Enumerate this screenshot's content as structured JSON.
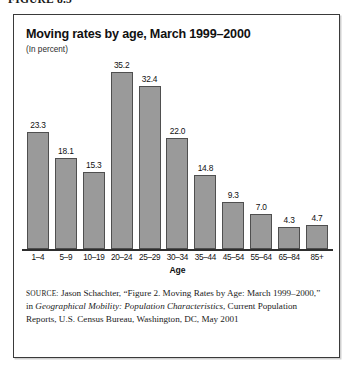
{
  "figure": {
    "caption": "FIGURE 8.5"
  },
  "chart_panel": {
    "title": "Moving rates by age, March 1999–2000",
    "subtitle": "(In percent)",
    "bar_fill_color": "#9a9a9a",
    "bar_outline_color": "#4f4f4f",
    "frame_color": "#3a3a3a"
  },
  "source": {
    "label": "SOURCE:",
    "text_part1": " Jason Schachter, “Figure 2. Moving Rates by Age: March 1999–2000,” in ",
    "italic_title": "Geographical Mobility: Population Characteristics",
    "text_part2": ", Current Population Reports, U.S. Census Bureau, Washington, DC, May 2001"
  },
  "chart_data": {
    "type": "bar",
    "title": "Moving rates by age, March 1999–2000",
    "subtitle": "(In percent)",
    "xlabel": "Age",
    "ylabel": "",
    "ylim": [
      0,
      35.2
    ],
    "grid": false,
    "legend": "none",
    "y_axis_visible": false,
    "value_labels_shown": true,
    "categories": [
      "1–4",
      "5–9",
      "10–19",
      "20–24",
      "25–29",
      "30–34",
      "35–44",
      "45–54",
      "55–64",
      "65–84",
      "85+"
    ],
    "values": [
      23.3,
      18.1,
      15.3,
      35.2,
      32.4,
      22.0,
      14.8,
      9.3,
      7.0,
      4.3,
      4.7
    ],
    "value_labels": [
      "23.3",
      "18.1",
      "15.3",
      "35.2",
      "32.4",
      "22.0",
      "14.8",
      "9.3",
      "7.0",
      "4.3",
      "4.7"
    ]
  }
}
